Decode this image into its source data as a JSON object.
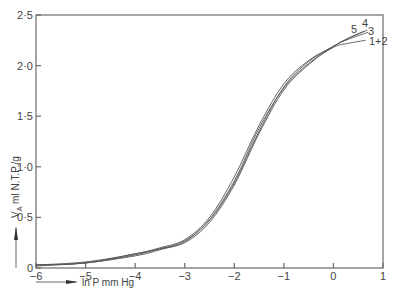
{
  "chart_data": {
    "type": "line",
    "title": "",
    "xlabel": "ln P mm Hg",
    "ylabel": "V_A ml N.T.P./g",
    "xlim": [
      -6,
      1
    ],
    "ylim": [
      0,
      2.5
    ],
    "grid": false,
    "legend": "curve labels placed at right end of curves",
    "x_ticks": [
      -6,
      -5,
      -4,
      -3,
      -2,
      -1,
      0,
      1
    ],
    "x_tick_labels": [
      "-6",
      "-5",
      "-4",
      "-3",
      "-2",
      "-1",
      "0",
      "1"
    ],
    "y_ticks": [
      0,
      0.5,
      1.0,
      1.5,
      2.0,
      2.5
    ],
    "y_tick_labels": [
      "0",
      "0·5",
      "1·0",
      "1·5",
      "2·0",
      "2·5"
    ],
    "series": [
      {
        "name": "1+2",
        "x": [
          -6.0,
          -5.0,
          -4.0,
          -3.5,
          -3.0,
          -2.5,
          -2.0,
          -1.5,
          -1.0,
          -0.5,
          0.0,
          0.3,
          0.65
        ],
        "values": [
          0.02,
          0.05,
          0.12,
          0.18,
          0.26,
          0.48,
          0.86,
          1.38,
          1.78,
          2.02,
          2.18,
          2.22,
          2.25
        ]
      },
      {
        "name": "3",
        "x": [
          -6.0,
          -5.0,
          -4.0,
          -3.5,
          -3.0,
          -2.5,
          -2.0,
          -1.5,
          -1.0,
          -0.5,
          0.0,
          0.3,
          0.7
        ],
        "values": [
          0.03,
          0.05,
          0.13,
          0.19,
          0.25,
          0.45,
          0.82,
          1.33,
          1.76,
          2.01,
          2.19,
          2.26,
          2.33
        ]
      },
      {
        "name": "4",
        "x": [
          -6.0,
          -5.0,
          -4.0,
          -3.5,
          -3.0,
          -2.5,
          -2.0,
          -1.5,
          -1.0,
          -0.5,
          0.0,
          0.3,
          0.68
        ],
        "values": [
          0.03,
          0.05,
          0.14,
          0.19,
          0.27,
          0.47,
          0.84,
          1.35,
          1.79,
          2.04,
          2.19,
          2.27,
          2.35
        ]
      },
      {
        "name": "5",
        "x": [
          -6.0,
          -5.0,
          -4.0,
          -3.5,
          -3.0,
          -2.5,
          -2.0,
          -1.5,
          -1.0,
          -0.5,
          0.0,
          0.3,
          0.62
        ],
        "values": [
          0.03,
          0.06,
          0.14,
          0.2,
          0.28,
          0.5,
          0.9,
          1.41,
          1.82,
          2.05,
          2.19,
          2.27,
          2.34
        ]
      }
    ]
  },
  "labels": {
    "x_axis_title": "ln P mm Hg",
    "y_axis_title_main": "V",
    "y_axis_title_sub": "A",
    "y_axis_title_rest": " ml N.T.P./g",
    "curve_labels": [
      {
        "text": "5",
        "x": 351,
        "y": 33
      },
      {
        "text": "4",
        "x": 362,
        "y": 27
      },
      {
        "text": "3",
        "x": 368,
        "y": 35
      },
      {
        "text": "1+2",
        "x": 369,
        "y": 45
      }
    ]
  }
}
